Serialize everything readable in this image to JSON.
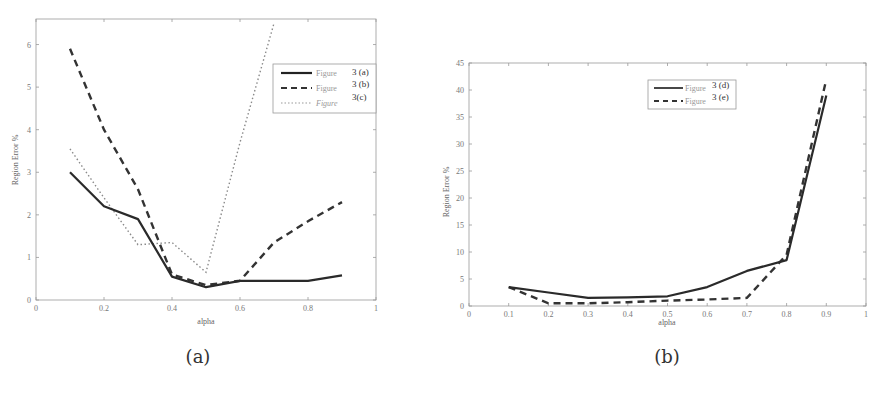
{
  "chart_data": [
    {
      "type": "line",
      "caption": "(a)",
      "title": "",
      "xlabel": "alpha",
      "ylabel": "Region Error %",
      "xlim": [
        0,
        1
      ],
      "ylim": [
        0,
        6.6
      ],
      "xticks": [
        "0",
        "0.2",
        "0.4",
        "0.6",
        "0.8",
        "1"
      ],
      "yticks": [
        "0",
        "1",
        "2",
        "3",
        "4",
        "5",
        "6"
      ],
      "grid": false,
      "legend_position": "upper right",
      "x": [
        0.1,
        0.2,
        0.3,
        0.4,
        0.5,
        0.6,
        0.7,
        0.8,
        0.9
      ],
      "series": [
        {
          "name": "Figure 3 (a)",
          "legend_word": "Figure",
          "legend_tag": "3 (a)",
          "style": "solid",
          "values": [
            3.0,
            2.2,
            1.9,
            0.55,
            0.3,
            0.45,
            0.45,
            0.45,
            0.58
          ]
        },
        {
          "name": "Figure 3 (b)",
          "legend_word": "Figure",
          "legend_tag": "3 (b)",
          "style": "dashed",
          "values": [
            5.9,
            4.0,
            2.6,
            0.6,
            0.35,
            0.45,
            1.35,
            1.85,
            2.3
          ]
        },
        {
          "name": "Figure 3(c)",
          "legend_word": "Figure",
          "legend_tag": "3(c)",
          "style": "dotted",
          "values": [
            3.55,
            2.4,
            1.3,
            1.35,
            0.65,
            3.7,
            6.5,
            null,
            null
          ]
        }
      ]
    },
    {
      "type": "line",
      "caption": "(b)",
      "title": "",
      "xlabel": "alpha",
      "ylabel": "Region Error %",
      "xlim": [
        0,
        1
      ],
      "ylim": [
        0,
        45
      ],
      "xticks": [
        "0",
        "0.1",
        "0.2",
        "0.3",
        "0.4",
        "0.5",
        "0.6",
        "0.7",
        "0.8",
        "0.9",
        "1"
      ],
      "yticks": [
        "0",
        "5",
        "10",
        "15",
        "20",
        "25",
        "30",
        "35",
        "40",
        "45"
      ],
      "grid": false,
      "legend_position": "upper center",
      "x": [
        0.1,
        0.2,
        0.3,
        0.4,
        0.5,
        0.6,
        0.7,
        0.8,
        0.9
      ],
      "series": [
        {
          "name": "Figure 3 (d)",
          "legend_word": "Figure",
          "legend_tag": "3 (d)",
          "style": "solid",
          "values": [
            3.5,
            2.5,
            1.5,
            1.6,
            1.8,
            3.5,
            6.5,
            8.5,
            39
          ]
        },
        {
          "name": "Figure 3 (e)",
          "legend_word": "Figure",
          "legend_tag": "3 (e)",
          "style": "dashed",
          "values": [
            3.5,
            0.5,
            0.5,
            0.7,
            1.0,
            1.2,
            1.5,
            9.5,
            42
          ]
        }
      ]
    }
  ],
  "colors": {
    "line": "#333333",
    "axis": "#888888",
    "dotted_line": "#888888"
  }
}
